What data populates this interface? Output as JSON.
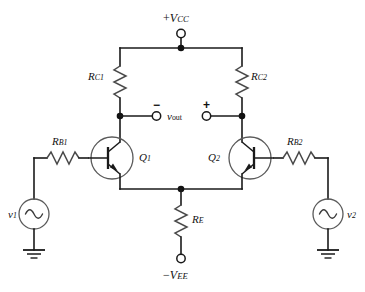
{
  "diagram": {
    "background_color": "#ffffff",
    "line_color": "#1a1a1a",
    "resistor_color": "#4a4a4a",
    "device_outline_color": "#5a5a5a"
  },
  "supplies": {
    "positive": {
      "label_prefix": "+",
      "label_main": "V",
      "label_sub": "CC",
      "terminal": "open-circle"
    },
    "negative": {
      "label_prefix": "−",
      "label_main": "V",
      "label_sub": "EE",
      "terminal": "open-circle"
    }
  },
  "resistors": [
    {
      "id": "RC1",
      "main": "R",
      "sub": "C1",
      "orientation": "vertical",
      "role": "collector-resistor-left"
    },
    {
      "id": "RC2",
      "main": "R",
      "sub": "C2",
      "orientation": "vertical",
      "role": "collector-resistor-right"
    },
    {
      "id": "RB1",
      "main": "R",
      "sub": "B1",
      "orientation": "horizontal",
      "role": "base-resistor-left"
    },
    {
      "id": "RB2",
      "main": "R",
      "sub": "B2",
      "orientation": "horizontal",
      "role": "base-resistor-right"
    },
    {
      "id": "RE",
      "main": "R",
      "sub": "E",
      "orientation": "vertical",
      "role": "emitter-resistor"
    }
  ],
  "transistors": [
    {
      "id": "Q1",
      "main": "Q",
      "sub": "1",
      "type": "npn",
      "facing": "right"
    },
    {
      "id": "Q2",
      "main": "Q",
      "sub": "2",
      "type": "npn",
      "facing": "left"
    }
  ],
  "sources": [
    {
      "id": "v1",
      "main": "v",
      "sub": "1",
      "type": "ac-sine",
      "grounded": true
    },
    {
      "id": "v2",
      "main": "v",
      "sub": "2",
      "type": "ac-sine",
      "grounded": true
    }
  ],
  "output": {
    "main": "v",
    "sub": "out",
    "minus_sign": "−",
    "plus_sign": "+",
    "minus_terminal": "open-circle",
    "plus_terminal": "open-circle"
  },
  "nodes": {
    "top_rail_junction": "junction-dot",
    "collector_left_junction": "junction-dot",
    "collector_right_junction": "junction-dot",
    "emitter_rail_junction": "junction-dot"
  }
}
